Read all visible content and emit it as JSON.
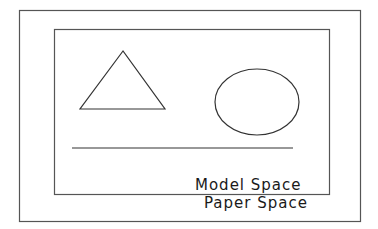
{
  "diagram": {
    "paper_space_label": "Paper Space",
    "model_space_label": "Model Space",
    "stroke_color": "#333333",
    "background": "#ffffff",
    "shapes": [
      "triangle",
      "ellipse",
      "horizontal-line"
    ]
  }
}
